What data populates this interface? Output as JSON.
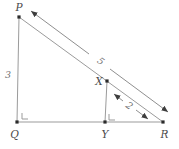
{
  "diagram": {
    "labels": {
      "P": "P",
      "Q": "Q",
      "R": "R",
      "X": "X",
      "Y": "Y"
    },
    "measures": {
      "PQ": "3",
      "PR": "5",
      "XR": "2"
    },
    "right_angles": [
      "Q",
      "Y"
    ]
  },
  "colors": {
    "background": "#ffffff",
    "line": "#9b9b9b",
    "arrow": "#8f8f8f",
    "arrowhead": "#3d3d3d",
    "point": "#2b2b2b",
    "label": "#4a4a4a",
    "measure_label": "#6f6f6f"
  }
}
